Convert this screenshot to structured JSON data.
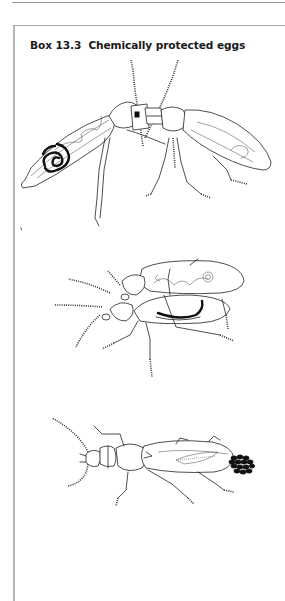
{
  "box": {
    "title": "Box 13.3  Chemically protected eggs"
  },
  "figures": [
    {
      "name": "beetle-mating-side-view",
      "description": "Beetle pair, abdomen cut-away showing coiled black gland"
    },
    {
      "name": "beetle-pair-cutaway",
      "description": "Two beetles, cut-away showing black spermatophore"
    },
    {
      "name": "female-beetle-with-eggs",
      "description": "Female beetle with egg cluster"
    }
  ],
  "colors": {
    "line": "#222222",
    "border": "#b5b5b5",
    "background": "#ffffff"
  }
}
